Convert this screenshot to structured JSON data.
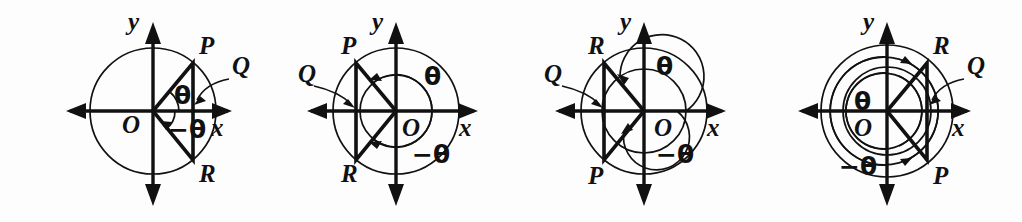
{
  "figure": {
    "background_color": "#fdfdfd",
    "ink_color": "#111111",
    "panels": [
      {
        "id": "panel-1",
        "index": 1,
        "center_x": 153,
        "center_y": 111,
        "axis_labels": {
          "x": "x",
          "y": "y"
        },
        "origin_label": "O",
        "point_labels": {
          "P": "P",
          "Q": "Q",
          "R": "R"
        },
        "angle_labels": {
          "positive": "θ",
          "negative": "−θ"
        },
        "point_positions": {
          "P": "upper-right",
          "Q": "on-positive-x-axis",
          "R": "lower-right"
        },
        "circles": [
          {
            "name": "unit-circle",
            "radius": 63
          }
        ],
        "terminal_angle_deg": 50,
        "negative_angle_deg": -50,
        "arc_radii": [
          26,
          22
        ],
        "arc_turns": 0
      },
      {
        "id": "panel-2",
        "index": 2,
        "center_x": 396,
        "center_y": 111,
        "axis_labels": {
          "x": "x",
          "y": "y"
        },
        "origin_label": "O",
        "point_labels": {
          "P": "P",
          "Q": "Q",
          "R": "R"
        },
        "angle_labels": {
          "positive": "θ",
          "negative": "−θ"
        },
        "point_positions": {
          "P": "upper-left",
          "Q": "on-negative-x-axis",
          "R": "lower-left"
        },
        "circles": [
          {
            "name": "outer-circle",
            "radius": 63
          },
          {
            "name": "inner-arc-circle",
            "radius": 36
          }
        ],
        "terminal_angle_deg": 130,
        "negative_angle_deg": -130,
        "arc_radii": [
          36
        ],
        "arc_turns": 0
      },
      {
        "id": "panel-3",
        "index": 3,
        "center_x": 644,
        "center_y": 111,
        "axis_labels": {
          "x": "x",
          "y": "y"
        },
        "origin_label": "O",
        "point_labels": {
          "P": "P",
          "Q": "Q",
          "R": "R"
        },
        "angle_labels": {
          "positive": "θ",
          "negative": "−θ"
        },
        "point_positions": {
          "P": "lower-left",
          "Q": "on-negative-x-axis",
          "R": "upper-left"
        },
        "circles": [
          {
            "name": "outer-circle",
            "radius": 63
          },
          {
            "name": "inner-arc-circle",
            "radius": 42
          }
        ],
        "terminal_angle_deg": 130,
        "negative_angle_deg": -130,
        "arc_radii": [
          42,
          33
        ],
        "arc_turns": 1
      },
      {
        "id": "panel-4",
        "index": 4,
        "center_x": 887,
        "center_y": 111,
        "axis_labels": {
          "x": "x",
          "y": "y"
        },
        "origin_label": "O",
        "point_labels": {
          "P": "P",
          "Q": "Q",
          "R": "R"
        },
        "angle_labels": {
          "positive": "θ",
          "negative": "−θ"
        },
        "point_positions": {
          "P": "lower-right",
          "Q": "on-positive-x-axis",
          "R": "upper-right"
        },
        "circles": [
          {
            "name": "outer-circle",
            "radius": 66
          },
          {
            "name": "inner-arc-circle",
            "radius": 44
          }
        ],
        "terminal_angle_deg": 50,
        "negative_angle_deg": -50,
        "arc_radii": [
          46,
          40,
          34
        ],
        "arc_turns": 2
      }
    ]
  }
}
